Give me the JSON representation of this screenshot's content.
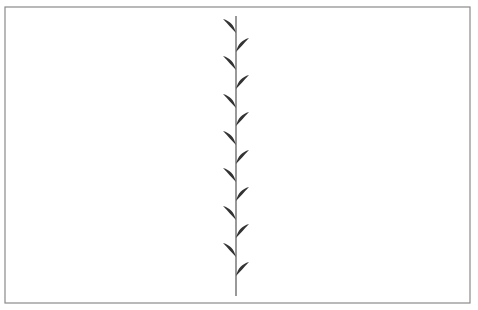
{
  "figure": {
    "frame": {
      "x": 5,
      "y": 7,
      "width": 465,
      "height": 296,
      "stroke": "#8a8a8a"
    },
    "stem": {
      "x": 236,
      "y1": 16,
      "y2": 296,
      "stroke": "#555555",
      "width": 1.2
    },
    "leaf_color": "#333333",
    "leaves": [
      {
        "side": "left",
        "base_y": 33
      },
      {
        "side": "right",
        "base_y": 52
      },
      {
        "side": "left",
        "base_y": 70
      },
      {
        "side": "right",
        "base_y": 89
      },
      {
        "side": "left",
        "base_y": 108
      },
      {
        "side": "right",
        "base_y": 126
      },
      {
        "side": "left",
        "base_y": 145
      },
      {
        "side": "right",
        "base_y": 164
      },
      {
        "side": "left",
        "base_y": 182
      },
      {
        "side": "right",
        "base_y": 201
      },
      {
        "side": "left",
        "base_y": 220
      },
      {
        "side": "right",
        "base_y": 238
      },
      {
        "side": "left",
        "base_y": 257
      },
      {
        "side": "right",
        "base_y": 276
      }
    ]
  }
}
